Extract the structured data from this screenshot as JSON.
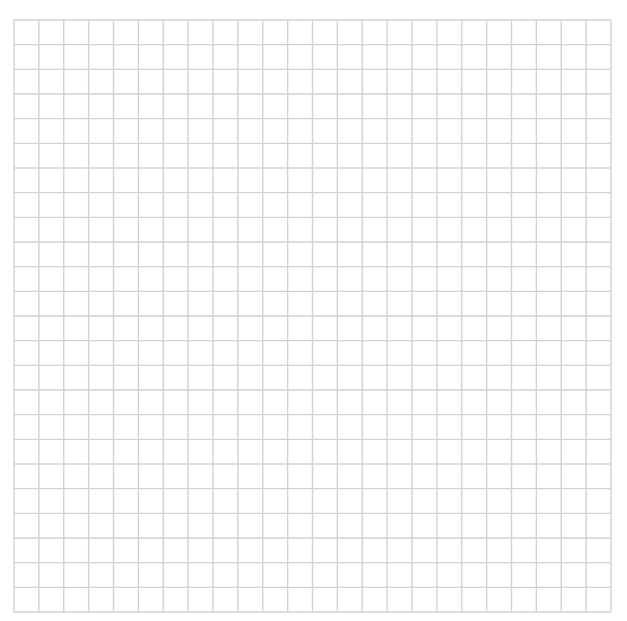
{
  "grid": {
    "columns": 24,
    "rows": 24,
    "left": 14,
    "top": 20,
    "right": 611,
    "bottom": 612,
    "line_color": "#d2d2d2",
    "line_width": 1.4,
    "background": "#ffffff"
  }
}
